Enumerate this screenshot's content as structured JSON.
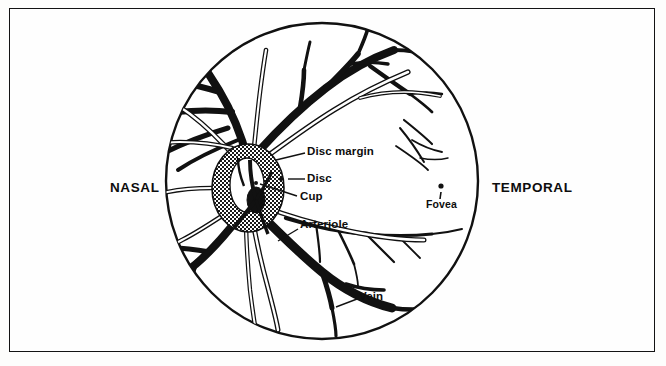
{
  "figure": {
    "type": "retinal-fundus-diagram",
    "background_color": "#fdfdfc",
    "ink_color": "#111111",
    "border_color": "#131313"
  },
  "orientation_labels": {
    "nasal": "NASAL",
    "temporal": "TEMPORAL"
  },
  "anatomy_labels": {
    "disc_margin": "Disc margin",
    "disc": "Disc",
    "cup": "Cup",
    "arteriole": "Arteriole",
    "vein": "Vein",
    "fovea": "Fovea"
  },
  "fundus": {
    "center_x": 322,
    "center_y": 181,
    "radius_x": 157,
    "radius_y": 159,
    "outline_color": "#111111"
  },
  "optic_disc": {
    "center_x": 248,
    "center_y": 188,
    "radius_x": 36,
    "radius_y": 44,
    "fill": "stipple-halftone",
    "fill_color": "#8c8c8c"
  },
  "optic_cup": {
    "center_x": 247,
    "center_y": 185,
    "radius_x": 17,
    "radius_y": 27,
    "fill_color": "#ffffff"
  },
  "fovea_marker": {
    "x": 441,
    "y": 190,
    "dot_color": "#111111"
  },
  "vessels": {
    "vein_color": "#111111",
    "arteriole_outline": "#111111",
    "arteriole_fill": "#ffffff"
  }
}
